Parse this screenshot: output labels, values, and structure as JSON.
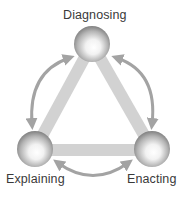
{
  "diagram": {
    "nodes": [
      {
        "id": "diagnosing",
        "label": "Diagnosing",
        "position": "top"
      },
      {
        "id": "explaining",
        "label": "Explaining",
        "position": "bottom-left"
      },
      {
        "id": "enacting",
        "label": "Enacting",
        "position": "bottom-right"
      }
    ],
    "edges": [
      {
        "from": "diagnosing",
        "to": "explaining",
        "type": "bar"
      },
      {
        "from": "diagnosing",
        "to": "enacting",
        "type": "bar"
      },
      {
        "from": "explaining",
        "to": "enacting",
        "type": "bar"
      }
    ],
    "cycle_arrows": [
      {
        "between": [
          "diagnosing",
          "explaining"
        ],
        "direction": "bidirectional",
        "side": "left"
      },
      {
        "between": [
          "diagnosing",
          "enacting"
        ],
        "direction": "bidirectional",
        "side": "right"
      },
      {
        "between": [
          "explaining",
          "enacting"
        ],
        "direction": "bidirectional",
        "side": "bottom"
      }
    ],
    "colors": {
      "bar": "#d2d2d2",
      "arrow": "#a3a3a3",
      "sphere_dark": "#6e6e6e",
      "sphere_light": "#ffffff",
      "text": "#3a3a3a"
    }
  }
}
